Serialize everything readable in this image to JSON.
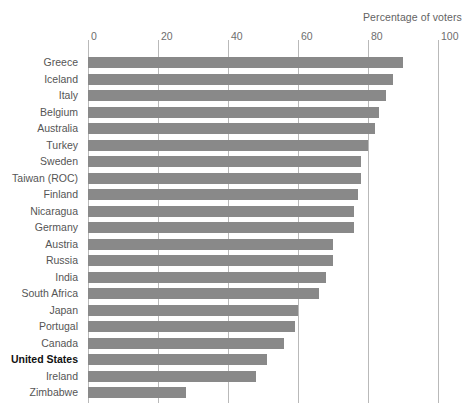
{
  "chart": {
    "title": "Percentage of voters",
    "axis": {
      "ticks": [
        "0",
        "20",
        "40",
        "60",
        "80",
        "100"
      ]
    }
  },
  "chart_data": {
    "type": "bar",
    "orientation": "horizontal",
    "title": "Percentage of voters",
    "xlabel": "Percentage of voters",
    "ylabel": "",
    "xlim": [
      0,
      100
    ],
    "grid": true,
    "legend": false,
    "highlight": "United States",
    "bar_color": "#898989",
    "categories": [
      "Greece",
      "Iceland",
      "Italy",
      "Belgium",
      "Australia",
      "Turkey",
      "Sweden",
      "Taiwan (ROC)",
      "Finland",
      "Nicaragua",
      "Germany",
      "Austria",
      "Russia",
      "India",
      "South Africa",
      "Japan",
      "Portugal",
      "Canada",
      "United States",
      "Ireland",
      "Zimbabwe"
    ],
    "values": [
      90,
      87,
      85,
      83,
      82,
      80,
      78,
      78,
      77,
      76,
      76,
      70,
      70,
      68,
      66,
      60,
      59,
      56,
      51,
      48,
      28
    ]
  }
}
